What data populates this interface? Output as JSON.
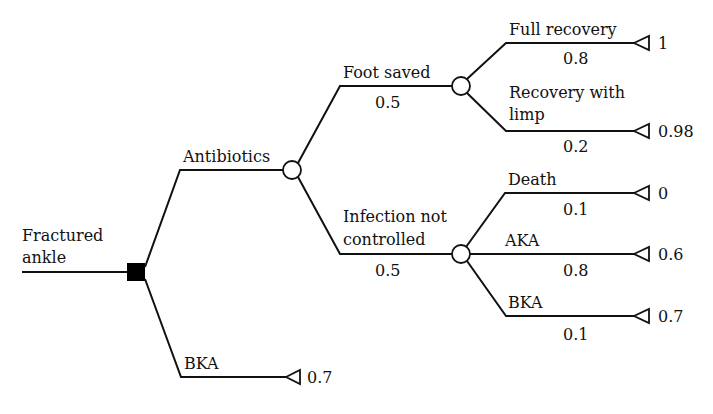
{
  "root": {
    "label_line1": "Fractured",
    "label_line2": "ankle",
    "node_type": "decision"
  },
  "decision_branches": [
    {
      "label": "Antibiotics",
      "node_type": "chance",
      "outcomes": [
        {
          "label": "Foot saved",
          "probability": "0.5",
          "node_type": "chance",
          "outcomes": [
            {
              "label": "Full recovery",
              "probability": "0.8",
              "utility": "1"
            },
            {
              "label_line1": "Recovery with",
              "label_line2": "limp",
              "probability": "0.2",
              "utility": "0.98"
            }
          ]
        },
        {
          "label_line1": "Infection not",
          "label_line2": "controlled",
          "probability": "0.5",
          "node_type": "chance",
          "outcomes": [
            {
              "label": "Death",
              "probability": "0.1",
              "utility": "0"
            },
            {
              "label": "AKA",
              "probability": "0.8",
              "utility": "0.6"
            },
            {
              "label": "BKA",
              "probability": "0.1",
              "utility": "0.7"
            }
          ]
        }
      ]
    },
    {
      "label": "BKA",
      "node_type": "terminal",
      "utility": "0.7"
    }
  ],
  "legend": {
    "decision_node": "filled square",
    "chance_node": "open circle",
    "terminal_node": "open triangle"
  }
}
